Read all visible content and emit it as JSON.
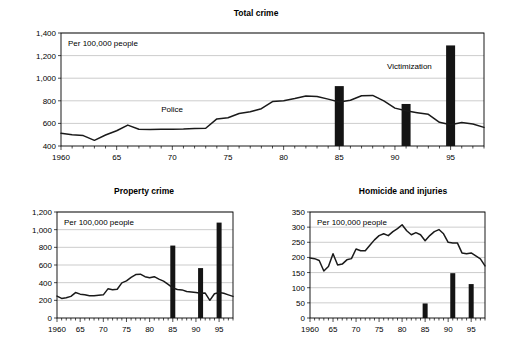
{
  "figure": {
    "width": 511,
    "height": 347,
    "background": "#ffffff",
    "line_color": "#1a1a1a",
    "bar_color": "#141414",
    "grid_color": "#a9a9a9"
  },
  "chart_data": [
    {
      "id": "total-crime",
      "type": "line",
      "title": "Total crime",
      "annotation": "Per 100,000 people",
      "xlabel": "",
      "ylabel": "",
      "grid": true,
      "legend": "inline-labels",
      "ylim": [
        400,
        1400
      ],
      "yticks": [
        400,
        600,
        800,
        1000,
        1200,
        1400
      ],
      "ytick_labels": [
        "400",
        "600",
        "800",
        "1,000",
        "1,200",
        "1,400"
      ],
      "xlim": [
        1960,
        1998
      ],
      "xticks": [
        1960,
        1965,
        1970,
        1975,
        1980,
        1985,
        1990,
        1995
      ],
      "xtick_labels": [
        "1960",
        "65",
        "70",
        "75",
        "80",
        "85",
        "90",
        "95"
      ],
      "series": [
        {
          "name": "Police",
          "label": "Police",
          "label_x": 1969,
          "label_y": 700,
          "x": [
            1960,
            1961,
            1962,
            1963,
            1964,
            1965,
            1966,
            1967,
            1968,
            1969,
            1970,
            1971,
            1972,
            1973,
            1974,
            1975,
            1976,
            1977,
            1978,
            1979,
            1980,
            1981,
            1982,
            1983,
            1984,
            1985,
            1986,
            1987,
            1988,
            1989,
            1990,
            1991,
            1992,
            1993,
            1994,
            1995,
            1996,
            1997,
            1998
          ],
          "values": [
            512,
            500,
            492,
            450,
            497,
            535,
            585,
            548,
            545,
            548,
            548,
            550,
            555,
            557,
            640,
            650,
            688,
            703,
            730,
            793,
            800,
            820,
            843,
            838,
            815,
            790,
            805,
            845,
            848,
            800,
            735,
            712,
            695,
            680,
            610,
            588,
            608,
            595,
            565,
            545
          ]
        }
      ],
      "bars": [
        {
          "name": "Victimization",
          "x": 1985,
          "value": 930
        },
        {
          "name": "Victimization",
          "x": 1991,
          "value": 772
        },
        {
          "name": "Victimization",
          "x": 1995,
          "value": 1290
        }
      ],
      "bar_series_label": "Victimization",
      "bar_label_x": 1991.3,
      "bar_label_y": 1080
    },
    {
      "id": "property-crime",
      "type": "line",
      "title": "Property crime",
      "annotation": "Per 100,000 people",
      "xlabel": "",
      "ylabel": "",
      "grid": true,
      "ylim": [
        0,
        1200
      ],
      "yticks": [
        0,
        200,
        400,
        600,
        800,
        1000,
        1200
      ],
      "ytick_labels": [
        "0",
        "200",
        "400",
        "600",
        "800",
        "1,000",
        "1,200"
      ],
      "xlim": [
        1960,
        1998
      ],
      "xticks": [
        1960,
        1965,
        1970,
        1975,
        1980,
        1985,
        1990,
        1995
      ],
      "xtick_labels": [
        "1960",
        "65",
        "70",
        "75",
        "80",
        "85",
        "90",
        "95"
      ],
      "series": [
        {
          "name": "Police",
          "x": [
            1960,
            1961,
            1962,
            1963,
            1964,
            1965,
            1966,
            1967,
            1968,
            1969,
            1970,
            1971,
            1972,
            1973,
            1974,
            1975,
            1976,
            1977,
            1978,
            1979,
            1980,
            1981,
            1982,
            1983,
            1984,
            1985,
            1986,
            1987,
            1988,
            1989,
            1990,
            1991,
            1992,
            1993,
            1994,
            1995,
            1996,
            1997,
            1998
          ],
          "values": [
            248,
            222,
            230,
            245,
            288,
            270,
            262,
            252,
            252,
            258,
            262,
            330,
            320,
            325,
            398,
            420,
            460,
            492,
            496,
            468,
            455,
            468,
            440,
            418,
            380,
            340,
            322,
            318,
            300,
            295,
            288,
            280,
            282,
            200,
            275,
            288,
            280,
            262,
            245
          ]
        }
      ],
      "bars": [
        {
          "name": "Victimization",
          "x": 1985,
          "value": 820
        },
        {
          "name": "Victimization",
          "x": 1991,
          "value": 565
        },
        {
          "name": "Victimization",
          "x": 1995,
          "value": 1080
        }
      ]
    },
    {
      "id": "homicide-and-injuries",
      "type": "line",
      "title": "Homicide and injuries",
      "annotation": "Per 100,000 people",
      "xlabel": "",
      "ylabel": "",
      "grid": true,
      "ylim": [
        0,
        350
      ],
      "yticks": [
        0,
        50,
        100,
        150,
        200,
        250,
        300,
        350
      ],
      "ytick_labels": [
        "0",
        "50",
        "100",
        "150",
        "200",
        "250",
        "300",
        "350"
      ],
      "xlim": [
        1960,
        1998
      ],
      "xticks": [
        1960,
        1965,
        1970,
        1975,
        1980,
        1985,
        1990,
        1995
      ],
      "xtick_labels": [
        "1960",
        "65",
        "70",
        "75",
        "80",
        "85",
        "90",
        "95"
      ],
      "series": [
        {
          "name": "Police",
          "x": [
            1960,
            1961,
            1962,
            1963,
            1964,
            1965,
            1966,
            1967,
            1968,
            1969,
            1970,
            1971,
            1972,
            1973,
            1974,
            1975,
            1976,
            1977,
            1978,
            1979,
            1980,
            1981,
            1982,
            1983,
            1984,
            1985,
            1986,
            1987,
            1988,
            1989,
            1990,
            1991,
            1992,
            1993,
            1994,
            1995,
            1996,
            1997,
            1998
          ],
          "values": [
            198,
            196,
            190,
            155,
            170,
            212,
            175,
            178,
            192,
            196,
            228,
            222,
            222,
            240,
            258,
            272,
            278,
            272,
            285,
            295,
            308,
            288,
            275,
            282,
            275,
            255,
            272,
            285,
            292,
            278,
            250,
            248,
            248,
            215,
            212,
            215,
            205,
            195,
            172
          ]
        }
      ],
      "bars": [
        {
          "name": "Victimization",
          "x": 1985,
          "value": 48
        },
        {
          "name": "Victimization",
          "x": 1991,
          "value": 148
        },
        {
          "name": "Victimization",
          "x": 1995,
          "value": 112
        }
      ]
    }
  ]
}
